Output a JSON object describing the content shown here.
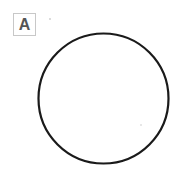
{
  "panel": {
    "label": "A"
  },
  "figure": {
    "shape": "circle",
    "cx": 103.5,
    "cy": 98.5,
    "r": 65,
    "stroke": "#1a1a1a",
    "stroke_width": 2.2,
    "fill": "none"
  },
  "dots": [
    {
      "x": 50,
      "y": 19,
      "color": "#b0b0b0"
    },
    {
      "x": 141,
      "y": 125,
      "color": "#c8c8c8"
    }
  ]
}
